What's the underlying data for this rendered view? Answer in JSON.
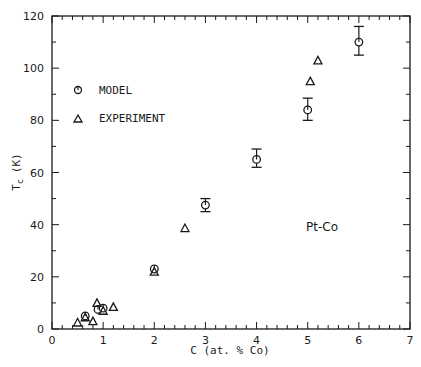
{
  "chart_data": {
    "type": "scatter",
    "title": "",
    "xlabel": "C (at. % Co)",
    "ylabel": "T_c (K)",
    "xlim": [
      0,
      7
    ],
    "ylim": [
      0,
      120
    ],
    "xticks": [
      0,
      1,
      2,
      3,
      4,
      5,
      6,
      7
    ],
    "yticks": [
      0,
      20,
      40,
      60,
      80,
      100,
      120
    ],
    "x_minor_step": 0.2,
    "y_minor_step": 10,
    "grid": false,
    "legend_position": "upper-left",
    "annotations": [
      {
        "text": "Pt-Co",
        "x": 5.4,
        "y": 38
      }
    ],
    "series": [
      {
        "name": "MODEL",
        "marker": "circle",
        "points": [
          {
            "x": 0.65,
            "y": 5,
            "err": null
          },
          {
            "x": 0.9,
            "y": 7.5,
            "err": null
          },
          {
            "x": 1.0,
            "y": 8,
            "err": null
          },
          {
            "x": 2.0,
            "y": 23,
            "err": null
          },
          {
            "x": 3.0,
            "y": 47.5,
            "err_low": 45,
            "err_high": 50
          },
          {
            "x": 4.0,
            "y": 65,
            "err_low": 62,
            "err_high": 69
          },
          {
            "x": 5.0,
            "y": 84,
            "err_low": 80,
            "err_high": 88.5
          },
          {
            "x": 6.0,
            "y": 110,
            "err_low": 105,
            "err_high": 116
          }
        ]
      },
      {
        "name": "EXPERIMENT",
        "marker": "triangle",
        "points": [
          {
            "x": 0.5,
            "y": 2.5
          },
          {
            "x": 0.65,
            "y": 4.5
          },
          {
            "x": 0.8,
            "y": 3
          },
          {
            "x": 0.88,
            "y": 10
          },
          {
            "x": 1.0,
            "y": 7
          },
          {
            "x": 1.2,
            "y": 8.5
          },
          {
            "x": 2.0,
            "y": 22
          },
          {
            "x": 2.6,
            "y": 38.7
          },
          {
            "x": 5.05,
            "y": 95
          },
          {
            "x": 5.2,
            "y": 103
          }
        ]
      }
    ]
  },
  "legend": {
    "model_label": "MODEL",
    "experiment_label": "EXPERIMENT"
  },
  "axes": {
    "x_title": "C (at. % Co)",
    "y_title_main": "T",
    "y_title_sub": "c",
    "y_title_unit": "(K)"
  },
  "annotation_text": "Pt-Co",
  "colors": {
    "ink": "#1a1a1a",
    "background": "#ffffff"
  }
}
